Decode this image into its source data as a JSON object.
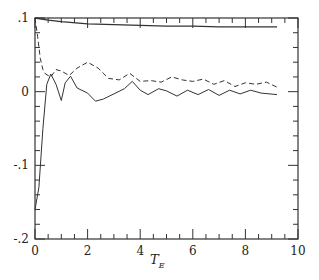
{
  "chart_data": {
    "type": "line",
    "title": "",
    "xlabel": "T_E",
    "xlabel_main": "T",
    "xlabel_sub": "E",
    "ylabel": "",
    "xlim": [
      0,
      10
    ],
    "ylim": [
      -0.2,
      0.1
    ],
    "x_ticks": [
      0,
      2,
      4,
      6,
      8,
      10
    ],
    "x_tick_labels": [
      "0",
      "2",
      "4",
      "6",
      "8",
      "10"
    ],
    "y_ticks": [
      0.1,
      0,
      -0.1,
      -0.2
    ],
    "y_tick_labels": [
      ".1",
      "0",
      "-.1",
      "-.2"
    ],
    "grid": false,
    "legend": null,
    "series": [
      {
        "name": "upper solid",
        "style": "solid",
        "x": [
          0,
          0.5,
          1,
          2,
          3,
          4,
          5,
          6,
          7,
          8,
          9,
          9.2
        ],
        "y": [
          0.1,
          0.097,
          0.095,
          0.092,
          0.091,
          0.09,
          0.089,
          0.089,
          0.088,
          0.088,
          0.088,
          0.088
        ]
      },
      {
        "name": "dashed",
        "style": "dashed",
        "x": [
          0,
          0.1,
          0.2,
          0.3,
          0.4,
          0.6,
          0.8,
          1.0,
          1.3,
          1.6,
          2.0,
          2.4,
          2.8,
          3.2,
          3.6,
          4.0,
          4.4,
          4.8,
          5.2,
          5.6,
          6.0,
          6.4,
          6.8,
          7.2,
          7.6,
          8.0,
          8.4,
          8.8,
          9.2
        ],
        "y": [
          0.1,
          0.075,
          0.045,
          0.03,
          0.024,
          0.02,
          0.03,
          0.028,
          0.022,
          0.032,
          0.04,
          0.032,
          0.018,
          0.016,
          0.025,
          0.014,
          0.015,
          0.013,
          0.02,
          0.016,
          0.014,
          0.017,
          0.01,
          0.015,
          0.007,
          0.012,
          0.01,
          0.013,
          0.006
        ]
      },
      {
        "name": "lower solid",
        "style": "solid",
        "x": [
          0,
          0.15,
          0.3,
          0.45,
          0.6,
          0.8,
          1.0,
          1.15,
          1.35,
          1.6,
          2.0,
          2.3,
          2.6,
          3.0,
          3.4,
          3.7,
          4.0,
          4.3,
          4.7,
          5.0,
          5.4,
          5.8,
          6.2,
          6.6,
          7.0,
          7.4,
          7.8,
          8.2,
          8.6,
          9.2
        ],
        "y": [
          -0.16,
          -0.13,
          -0.05,
          0.01,
          0.024,
          0.01,
          -0.012,
          0.012,
          0.021,
          0.005,
          -0.002,
          -0.013,
          -0.01,
          -0.003,
          0.004,
          0.014,
          0.002,
          -0.004,
          0.004,
          0.001,
          -0.006,
          0.002,
          -0.004,
          0.003,
          -0.005,
          0.002,
          -0.003,
          0.002,
          -0.002,
          -0.004
        ]
      }
    ]
  }
}
